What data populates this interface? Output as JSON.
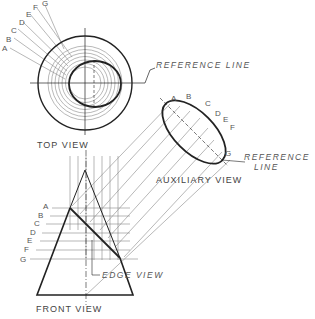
{
  "labels": {
    "top_view": "TOP VIEW",
    "front_view": "FRONT VIEW",
    "auxiliary_view": "AUXILIARY VIEW",
    "reference_line_top": "REFERENCE LINE",
    "reference_line_aux_1": "REFERENCE",
    "reference_line_aux_2": "LINE",
    "edge_view": "EDGE VIEW"
  },
  "cutting_plane_letters": [
    "A",
    "B",
    "C",
    "D",
    "E",
    "F",
    "G"
  ],
  "colors": {
    "line": "#222222",
    "thin": "#777777",
    "text": "#444444"
  }
}
